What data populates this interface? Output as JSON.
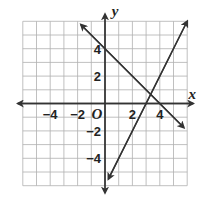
{
  "chart_data": {
    "type": "line",
    "title": "",
    "xlabel": "x",
    "ylabel": "y",
    "origin_label": "O",
    "xlim": [
      -6,
      6
    ],
    "ylim": [
      -6,
      6
    ],
    "grid": true,
    "x_tick_labels": [
      "−4",
      "−2",
      "2",
      "4"
    ],
    "x_tick_values": [
      -4,
      -2,
      2,
      4
    ],
    "y_tick_labels": [
      "4",
      "2",
      "−2",
      "−4"
    ],
    "y_tick_values": [
      4,
      2,
      -2,
      -4
    ],
    "series": [
      {
        "name": "line-1",
        "equation": "y = -x + 4",
        "from": [
          -1.75,
          5.75
        ],
        "to": [
          5.75,
          -1.75
        ]
      },
      {
        "name": "line-2",
        "equation": "y = 2x - 6",
        "from": [
          0.25,
          -5.5
        ],
        "to": [
          6,
          6
        ]
      }
    ],
    "intersection": [
      3.33,
      0.67
    ],
    "colors": {
      "grid": "#b0b0b0",
      "axis": "#333333",
      "line": "#333333"
    }
  }
}
